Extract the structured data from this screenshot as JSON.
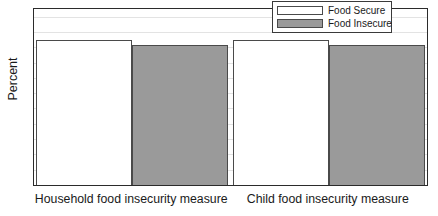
{
  "chart_data": {
    "type": "bar",
    "title": "",
    "xlabel": "",
    "ylabel": "Percent",
    "ylim": [
      0,
      57.5
    ],
    "yticks": [
      0,
      5,
      10,
      15,
      20,
      25,
      30,
      35,
      40,
      45,
      50,
      55
    ],
    "grid": true,
    "legend_position": "top-right",
    "categories": [
      "Household food insecurity measure",
      "Child food insecurity measure"
    ],
    "series": [
      {
        "name": "Food Secure",
        "values": [
          47.5,
          47.5
        ],
        "color": "#ffffff"
      },
      {
        "name": "Food Insecure",
        "values": [
          45.6,
          45.8
        ],
        "color": "#9a9a9a"
      }
    ]
  },
  "axis": {
    "y_title": "Percent",
    "tick_labels": [
      "55",
      "50",
      "45",
      "40",
      "35",
      "30",
      "25",
      "20",
      "15",
      "10",
      "5",
      "0"
    ]
  },
  "legend": {
    "entries": [
      {
        "label": "Food Secure"
      },
      {
        "label": "Food Insecure"
      }
    ]
  }
}
